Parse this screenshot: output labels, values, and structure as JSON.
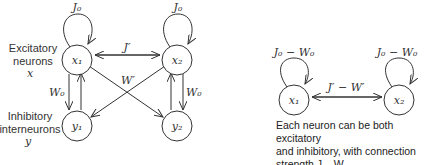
{
  "left_diagram": {
    "row_labels": {
      "excitatory": [
        "Excitatory",
        "neurons",
        "x"
      ],
      "inhibitory": [
        "Inhibitory",
        "interneurons",
        "y"
      ]
    },
    "nodes": [
      {
        "id": "x1",
        "label": "x₁"
      },
      {
        "id": "x2",
        "label": "x₂"
      },
      {
        "id": "y1",
        "label": "y₁"
      },
      {
        "id": "y2",
        "label": "y₂"
      }
    ],
    "edges": {
      "self_loop_x1": "J₀",
      "self_loop_x2": "J₀",
      "x1_x2": "J′",
      "cross": "W′",
      "x1_y1": "W₀",
      "x2_y2": "W₀"
    }
  },
  "right_diagram": {
    "nodes": [
      {
        "id": "x1",
        "label": "x₁"
      },
      {
        "id": "x2",
        "label": "x₂"
      }
    ],
    "edges": {
      "self_loop_x1": "J₀ − W₀",
      "self_loop_x2": "J₀ − W₀",
      "x1_x2": "J′ − W′"
    },
    "caption": [
      "Each neuron can be both excitatory",
      "and inhibitory, with connection",
      "strength J – W"
    ]
  }
}
